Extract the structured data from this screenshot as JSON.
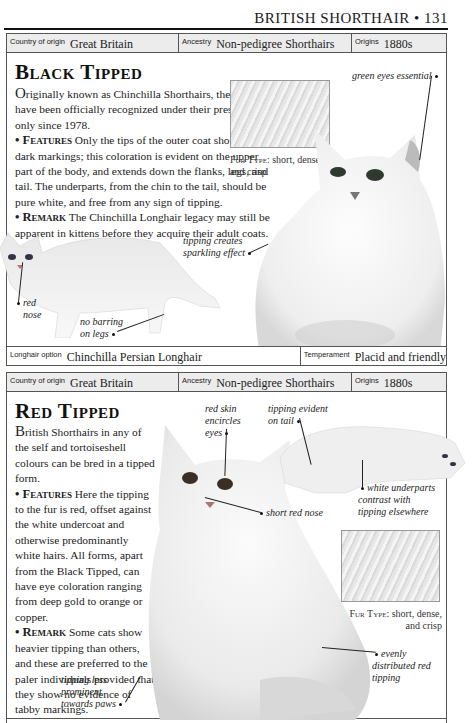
{
  "page": {
    "running_head": "BRITISH SHORTHAIR • 131"
  },
  "black_tipped": {
    "info_bar": {
      "country_label": "Country of origin",
      "country_value": "Great Britain",
      "ancestry_label": "Ancestry",
      "ancestry_value": "Non-pedigree Shorthairs",
      "origins_label": "Origins",
      "origins_value": "1880s"
    },
    "title": "Black Tipped",
    "intro_dropcap": "O",
    "intro": "riginally known as Chinchilla Shorthairs, these cats have been officially recognized under their present name only since 1978.",
    "features_label": "• Features",
    "features_text": " Only the tips of the outer coat should show dark markings; this coloration is evident on the upper part of the body, and extends down the flanks, legs, and tail. The underparts, from the chin to the tail, should be pure white, and free from any sign of tipping.",
    "remark_label": "• Remark",
    "remark_text": " The Chinchilla Longhair legacy may still be apparent in kittens before they acquire their adult coats.",
    "fur_type_label": "Fur Type:",
    "fur_type_value": " short, dense, and crisp",
    "callouts": {
      "green_eyes": "green eyes essential",
      "sparkling_1": "tipping creates",
      "sparkling_2": "sparkling effect",
      "red_nose_1": "red",
      "red_nose_2": "nose",
      "no_barring_1": "no barring",
      "no_barring_2": "on legs"
    },
    "footer_bar": {
      "longhair_label": "Longhair option",
      "longhair_value": "Chinchilla Persian Longhair",
      "temperament_label": "Temperament",
      "temperament_value": "Placid and friendly"
    }
  },
  "red_tipped": {
    "info_bar": {
      "country_label": "Country of origin",
      "country_value": "Great Britain",
      "ancestry_label": "Ancestry",
      "ancestry_value": "Non-pedigree Shorthairs",
      "origins_label": "Origins",
      "origins_value": "1880s"
    },
    "title": "Red Tipped",
    "intro_dropcap": "B",
    "intro": "ritish Shorthairs in any of the self and tortoiseshell colours can be bred in a tipped form.",
    "features_label": "• Features",
    "features_text": " Here the tipping to the fur is red, offset against the white undercoat and otherwise predominantly white hairs. All forms, apart from the Black Tipped, can have eye coloration ranging from deep gold to orange or copper.",
    "remark_label": "• Remark",
    "remark_text": " Some cats show heavier tipping than others, and these are preferred to the paler individuals provided that they show no evidence of tabby markings.",
    "fur_type_label": "Fur Type:",
    "fur_type_value": " short, dense, and crisp",
    "callouts": {
      "red_skin_1": "red skin",
      "red_skin_2": "encircles",
      "red_skin_3": "eyes",
      "tail_1": "tipping evident",
      "tail_2": "on tail",
      "short_nose": "short red nose",
      "underparts_1": "white underparts",
      "underparts_2": "contrast with",
      "underparts_3": "tipping elsewhere",
      "evenly_1": "evenly",
      "evenly_2": "distributed red",
      "evenly_3": "tipping",
      "paws_1": "tipping less",
      "paws_2": "prominent",
      "paws_3": "towards paws"
    }
  }
}
